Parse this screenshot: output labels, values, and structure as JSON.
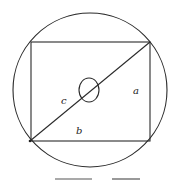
{
  "diagram": {
    "colors": {
      "stroke": "#2a2a2a",
      "background": "#ffffff"
    },
    "circle": {
      "cx": 90,
      "cy": 90,
      "r": 77
    },
    "rectangle": {
      "x1": 31,
      "y1": 42,
      "x2": 150,
      "y2": 141
    },
    "diagonal": {
      "from": [
        30,
        141
      ],
      "to": [
        150,
        42
      ]
    },
    "center_ellipse": {
      "cx": 89,
      "cy": 90,
      "rx": 10,
      "ry": 12
    },
    "labels": {
      "side_a": "a",
      "side_b": "b",
      "diagonal_c": "c"
    }
  }
}
